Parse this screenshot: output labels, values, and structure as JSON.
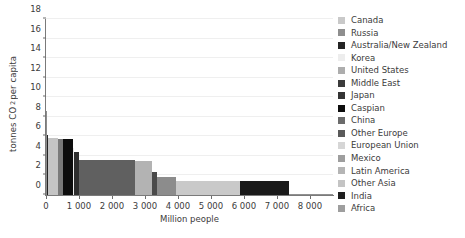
{
  "chart_data": {
    "type": "bar",
    "title": "",
    "subtitle": "",
    "xlabel": "Million people",
    "ylabel": "tonnes CO2 per capita",
    "ylabel_html": "tonnes CO<sub>2</sub> per capita",
    "xlim": [
      0,
      8700
    ],
    "ylim": [
      0,
      18
    ],
    "grid": true,
    "legend_position": "right",
    "xticks": [
      0,
      1000,
      2000,
      3000,
      4000,
      5000,
      6000,
      7000,
      8000
    ],
    "xtick_labels": [
      "0",
      "1 000",
      "2 000",
      "3 000",
      "4 000",
      "5 000",
      "6 000",
      "7 000",
      "8 000"
    ],
    "yticks": [
      0,
      2,
      4,
      6,
      8,
      10,
      12,
      14,
      16,
      18
    ],
    "ytick_labels": [
      "0",
      "2",
      "4",
      "6",
      "8",
      "10",
      "12",
      "14",
      "16",
      "18"
    ],
    "note": "Variable-width (Marimekko) bar chart: bar width = population (million people), bar height = tonnes CO2 per capita. Bars are stacked left-to-right in descending per-capita order.",
    "categories": [
      "Canada",
      "Russia",
      "Australia/New Zealand",
      "Korea",
      "United States",
      "Middle East",
      "Japan",
      "Caspian",
      "China",
      "Other Europe",
      "European Union",
      "Mexico",
      "Latin America",
      "Other Asia",
      "India",
      "Africa"
    ],
    "series": [
      {
        "name": "tonnes CO2 per capita",
        "bars": [
          {
            "label": "Canada",
            "value": 8.6,
            "width": 34,
            "x_start": 0,
            "color": "#8c8c8c"
          },
          {
            "label": "Australia/New Zealand",
            "value": 6.1,
            "width": 26,
            "x_start": 34,
            "color": "#242424"
          },
          {
            "label": "United States",
            "value": 5.8,
            "width": 310,
            "x_start": 60,
            "color": "#c4c4c4"
          },
          {
            "label": "Russia",
            "value": 5.75,
            "width": 145,
            "x_start": 370,
            "color": "#7a7a7a"
          },
          {
            "label": "Caspian",
            "value": 5.7,
            "width": 300,
            "x_start": 515,
            "color": "#0d0d0d"
          },
          {
            "label": "Korea",
            "value": 4.8,
            "width": 48,
            "x_start": 815,
            "color": "#ededed"
          },
          {
            "label": "Japan",
            "value": 4.35,
            "width": 127,
            "x_start": 863,
            "color": "#2e2e2e"
          },
          {
            "label": "Middle East",
            "value": 3.6,
            "width": 1710,
            "x_start": 990,
            "color": "#606060"
          },
          {
            "label": "European Union",
            "value": 3.45,
            "width": 500,
            "x_start": 2700,
            "color": "#b3b3b3"
          },
          {
            "label": "Other Europe",
            "value": 2.4,
            "width": 150,
            "x_start": 3200,
            "color": "#4a4a4a"
          },
          {
            "label": "Mexico",
            "value": 1.8,
            "width": 580,
            "x_start": 3350,
            "color": "#8c8c8c"
          },
          {
            "label": "Latin America",
            "value": 1.45,
            "width": 1960,
            "x_start": 3930,
            "color": "#c9c9c9"
          },
          {
            "label": "India",
            "value": 1.45,
            "width": 1470,
            "x_start": 5890,
            "color": "#1a1a1a"
          },
          {
            "label": "Africa",
            "value": 0.15,
            "width": 1340,
            "x_start": 7360,
            "color": "#909090"
          }
        ]
      }
    ],
    "legend": [
      {
        "label": "Canada",
        "color": "#c9c9c9"
      },
      {
        "label": "Russia",
        "color": "#8e8e8e"
      },
      {
        "label": "Australia/New Zealand",
        "color": "#242424"
      },
      {
        "label": "Korea",
        "color": "#ededed"
      },
      {
        "label": "United States",
        "color": "#adadad"
      },
      {
        "label": "Middle East",
        "color": "#3b3b3b"
      },
      {
        "label": "Japan",
        "color": "#343434"
      },
      {
        "label": "Caspian",
        "color": "#0d0d0d"
      },
      {
        "label": "China",
        "color": "#6b6b6b"
      },
      {
        "label": "Other Europe",
        "color": "#5a5a5a"
      },
      {
        "label": "European Union",
        "color": "#d6d6d6"
      },
      {
        "label": "Mexico",
        "color": "#9e9e9e"
      },
      {
        "label": "Latin America",
        "color": "#b5b5b5"
      },
      {
        "label": "Other Asia",
        "color": "#c4c4c4"
      },
      {
        "label": "India",
        "color": "#1f1f1f"
      },
      {
        "label": "Africa",
        "color": "#9e9e9e"
      }
    ]
  }
}
